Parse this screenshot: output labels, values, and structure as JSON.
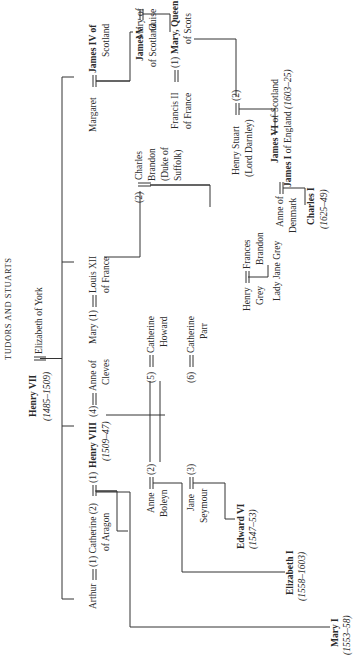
{
  "title": "TUDORS AND STUARTS",
  "people": {
    "henry_vii": {
      "name": "Henry VII",
      "reign": "(1485–1509)"
    },
    "elizabeth_of_york": {
      "name": "Elizabeth of York"
    },
    "arthur": {
      "name": "Arthur"
    },
    "catherine_of_aragon": {
      "line1": "(1) Catherine (2)",
      "line2": "of Aragon"
    },
    "henry_viii": {
      "prefix": "(1)",
      "name": "Henry VIII",
      "suffix": "(4)",
      "reign": "(1509–47)"
    },
    "anne_of_cleves": {
      "line1": "Anne of",
      "line2": "Cleves"
    },
    "anne_boleyn": {
      "line1": "Anne",
      "line2": "Boleyn",
      "marker": "(2)"
    },
    "jane_seymour": {
      "line1": "Jane",
      "line2": "Seymour",
      "marker": "(3)"
    },
    "catherine_howard": {
      "marker": "(5)",
      "line1": "Catherine",
      "line2": "Howard"
    },
    "catherine_parr": {
      "marker": "(6)",
      "line1": "Catherine",
      "line2": "Parr"
    },
    "mary_i": {
      "name": "Mary I",
      "reign": "(1553–58)"
    },
    "elizabeth_i": {
      "name": "Elizabeth I",
      "reign": "(1558–1603)"
    },
    "edward_vi": {
      "name": "Edward VI",
      "reign": "(1547–53)"
    },
    "mary_tudor": {
      "name": "Mary (1)"
    },
    "louis_xii": {
      "line1": "Louis XII",
      "line2": "of France"
    },
    "charles_brandon": {
      "marker": "(2)",
      "line1": "Charles",
      "line2": "Brandon",
      "line3": "(Duke of",
      "line4": "Suffolk)"
    },
    "frances_brandon": {
      "line1": "Frances",
      "line2": "Brandon"
    },
    "henry_grey": {
      "line1": "Henry",
      "line2": "Grey"
    },
    "lady_jane_grey": {
      "name": "Lady Jane Grey"
    },
    "margaret": {
      "name": "Margaret"
    },
    "james_iv": {
      "line1": "James IV of",
      "line2": "Scotland"
    },
    "james_v": {
      "line1": "James V",
      "line2": "of Scotland"
    },
    "mary_of_guise": {
      "line1": "Mary of",
      "line2": "Guise"
    },
    "francis_ii": {
      "line1": "Francis II",
      "line2": "of France"
    },
    "mary_queen_of_scots": {
      "prefix": "(1)",
      "line1": "Mary, Queen",
      "line2": "of Scots"
    },
    "henry_stuart": {
      "line1": "Henry Stuart",
      "line2": "(Lord Darnley)",
      "marker": "(2)"
    },
    "james_vi": {
      "line1_bold": "James VI",
      "line1_rest": " of Scotland",
      "line2_bold": "James I",
      "line2_rest": " of England ",
      "reign": "(1603–25)"
    },
    "anne_of_denmark": {
      "line1": "Anne of",
      "line2": "Denmark"
    },
    "charles_i": {
      "name": "Charles I",
      "reign": "(1625–49)"
    }
  }
}
